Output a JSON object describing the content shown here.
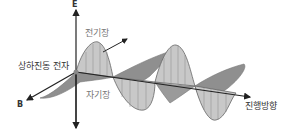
{
  "figure": {
    "labels": {
      "e_axis": "E",
      "b_axis": "B",
      "electric_field": "전기장",
      "magnetic_field": "자기장",
      "oscillating_electron": "상하진동 전자",
      "propagation_direction": "진행방향"
    },
    "colors": {
      "axis": "#222222",
      "electric_field_fill": "#c8c8c8",
      "magnetic_field_fill": "#8f8f8f",
      "outline": "#666666"
    }
  }
}
